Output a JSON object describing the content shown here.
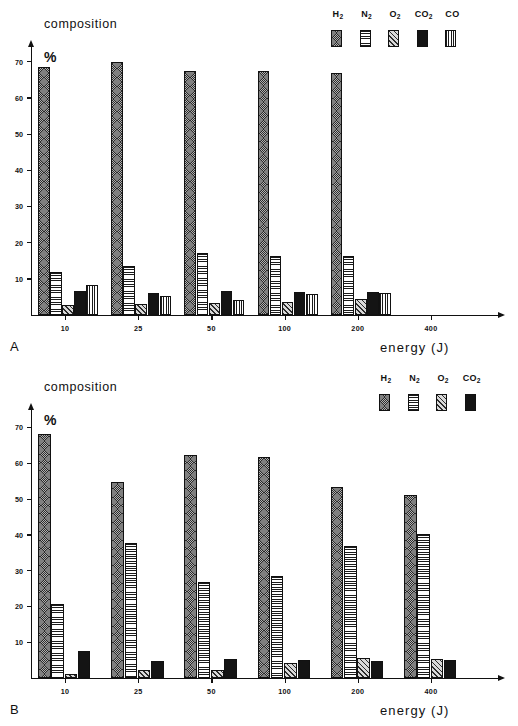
{
  "figure": {
    "panels": [
      {
        "id": "A",
        "letter": "A",
        "y_axis_title": "composition",
        "y_axis_unit": "%",
        "x_axis_title": "energy (J)"
      },
      {
        "id": "B",
        "letter": "B",
        "y_axis_title": "composition",
        "y_axis_unit": "%",
        "x_axis_title": "energy (J)"
      }
    ]
  },
  "chart_data": [
    {
      "type": "bar",
      "panel": "A",
      "title": "composition",
      "xlabel": "energy (J)",
      "ylabel": "%",
      "ylim": [
        0,
        75
      ],
      "yticks": [
        10,
        20,
        30,
        40,
        50,
        60,
        70
      ],
      "grid": false,
      "legend_position": "top-right",
      "categories": [
        "10",
        "25",
        "50",
        "100",
        "200",
        "400"
      ],
      "series": [
        {
          "name": "H2",
          "label": "H",
          "sub": "2",
          "pattern": "dark-crosshatch",
          "values": [
            68.5,
            69.8,
            67.5,
            67.5,
            66.8,
            null
          ]
        },
        {
          "name": "N2",
          "label": "N",
          "sub": "2",
          "pattern": "horizontal-lines",
          "values": [
            12.0,
            13.5,
            17.0,
            16.2,
            16.3,
            null
          ]
        },
        {
          "name": "O2",
          "label": "O",
          "sub": "2",
          "pattern": "diagonal-hatch",
          "values": [
            2.8,
            3.0,
            3.3,
            3.6,
            4.4,
            null
          ]
        },
        {
          "name": "CO2",
          "label": "CO",
          "sub": "2",
          "pattern": "solid-black",
          "values": [
            6.6,
            6.2,
            6.7,
            6.3,
            6.3,
            null
          ]
        },
        {
          "name": "CO",
          "label": "CO",
          "sub": "",
          "pattern": "vertical-lines",
          "values": [
            8.2,
            5.3,
            4.2,
            5.9,
            6.2,
            null
          ]
        }
      ]
    },
    {
      "type": "bar",
      "panel": "B",
      "title": "composition",
      "xlabel": "energy (J)",
      "ylabel": "%",
      "ylim": [
        0,
        75
      ],
      "yticks": [
        10,
        20,
        30,
        40,
        50,
        60,
        70
      ],
      "grid": false,
      "legend_position": "top-right",
      "categories": [
        "10",
        "25",
        "50",
        "100",
        "200",
        "400"
      ],
      "series": [
        {
          "name": "H2",
          "label": "H",
          "sub": "2",
          "pattern": "dark-crosshatch",
          "values": [
            68.2,
            54.8,
            62.3,
            61.8,
            53.4,
            51.0
          ]
        },
        {
          "name": "N2",
          "label": "N",
          "sub": "2",
          "pattern": "horizontal-lines",
          "values": [
            20.6,
            37.7,
            26.9,
            28.6,
            36.9,
            40.1
          ]
        },
        {
          "name": "O2",
          "label": "O",
          "sub": "2",
          "pattern": "diagonal-hatch",
          "values": [
            1.0,
            2.2,
            2.1,
            4.3,
            5.5,
            5.3
          ]
        },
        {
          "name": "CO2",
          "label": "CO",
          "sub": "2",
          "pattern": "solid-black",
          "values": [
            7.5,
            4.7,
            5.4,
            5.1,
            4.8,
            4.9
          ]
        }
      ]
    }
  ]
}
